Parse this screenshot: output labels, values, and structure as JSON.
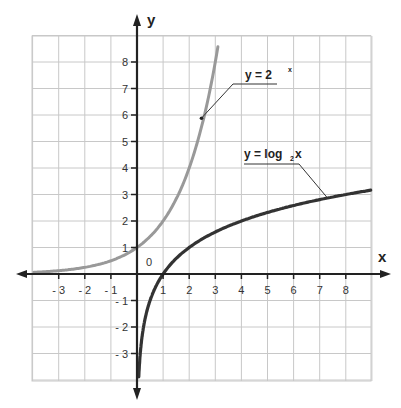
{
  "chart_data": {
    "type": "line",
    "title": "",
    "xlabel": "x",
    "ylabel": "y",
    "origin_label": "0",
    "xlim": [
      -4,
      9
    ],
    "ylim": [
      -4,
      9
    ],
    "grid": true,
    "x_ticks": [
      -3,
      -2,
      -1,
      1,
      2,
      3,
      4,
      5,
      6,
      7,
      8
    ],
    "x_tick_labels": [
      "- 3",
      "- 2",
      "- 1",
      "1",
      "2",
      "3",
      "4",
      "5",
      "6",
      "7",
      "8"
    ],
    "y_ticks": [
      8,
      7,
      6,
      5,
      4,
      3,
      2,
      1,
      -1,
      -2,
      -3
    ],
    "y_tick_labels": [
      "8",
      "7",
      "6",
      "5",
      "4",
      "3",
      "2",
      "1",
      "- 1",
      "- 2",
      "- 3"
    ],
    "series": [
      {
        "name": "y = 2^x",
        "label_main": "y = 2",
        "label_sup": "x",
        "color": "#999999",
        "function": "exp2",
        "x": [
          -4,
          -3,
          -2,
          -1,
          0,
          1,
          2,
          2.5,
          3.1
        ],
        "values": [
          0.0625,
          0.125,
          0.25,
          0.5,
          1,
          2,
          4,
          5.66,
          8.57
        ],
        "annotation_point": [
          2.5,
          5.9
        ]
      },
      {
        "name": "y = log2 x",
        "label_main": "y = log",
        "label_sub": "2",
        "label_tail": " x",
        "color": "#333333",
        "function": "log2",
        "x": [
          0.07,
          0.125,
          0.25,
          0.5,
          1,
          2,
          4,
          7.3,
          9
        ],
        "values": [
          -3.84,
          -3,
          -2,
          -1,
          0,
          1,
          2,
          2.87,
          3.17
        ],
        "annotation_point": [
          7.3,
          2.87
        ]
      }
    ],
    "legend_position": "inline annotations with leader lines"
  }
}
